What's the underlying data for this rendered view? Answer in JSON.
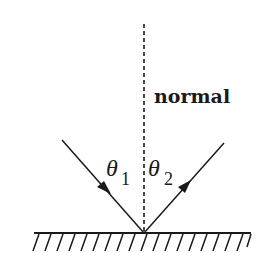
{
  "diagram": {
    "labels": {
      "normal": "normal",
      "theta1_symbol": "θ",
      "theta1_subscript": "1",
      "theta2_symbol": "θ",
      "theta2_subscript": "2"
    },
    "elements": {
      "normal_line": {
        "style": "dashed",
        "x": 144,
        "y_top": 24,
        "y_bottom": 233
      },
      "mirror_surface": {
        "x_start": 34,
        "x_end": 251,
        "y": 233,
        "hatched": true,
        "hatch_count": 19
      },
      "incident_ray": {
        "from": [
          62,
          140
        ],
        "to": [
          144,
          233
        ],
        "arrow": "toward mirror"
      },
      "reflected_ray": {
        "from": [
          144,
          233
        ],
        "to": [
          224,
          143
        ],
        "arrow": "away from mirror"
      }
    },
    "colors": {
      "ink": "#1a1a1a",
      "background": "#ffffff"
    }
  }
}
